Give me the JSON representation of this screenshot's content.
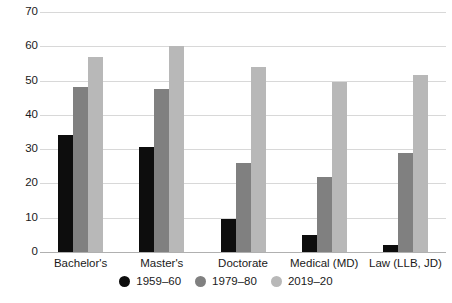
{
  "chart_data": {
    "type": "bar",
    "title": "",
    "subtitle": "",
    "xlabel": "",
    "ylabel": "",
    "ylim": [
      0,
      70
    ],
    "ytick_step": 10,
    "yticks": [
      0,
      10,
      20,
      30,
      40,
      50,
      60,
      70
    ],
    "ytick_labels": [
      "0",
      "10",
      "20",
      "30",
      "40",
      "50",
      "60",
      "70"
    ],
    "grid": true,
    "legend_position": "bottom-center",
    "categories": [
      "Bachelor's",
      "Master's",
      "Doctorate",
      "Medical (MD)",
      "Law (LLB, JD)"
    ],
    "series": [
      {
        "name": "1959–60",
        "color": "#0d0d0d",
        "values": [
          34,
          30.5,
          9.5,
          5,
          2
        ]
      },
      {
        "name": "1979–80",
        "color": "#808080",
        "values": [
          48,
          47.5,
          26,
          22,
          29
        ]
      },
      {
        "name": "2019–20",
        "color": "#b8b8b8",
        "values": [
          57,
          60,
          54,
          49.5,
          51.5
        ]
      }
    ]
  },
  "colors": {
    "gridline": "#d8d8d8",
    "baseline": "#b0b0b0",
    "text": "#1a1a1a",
    "background": "#ffffff"
  }
}
